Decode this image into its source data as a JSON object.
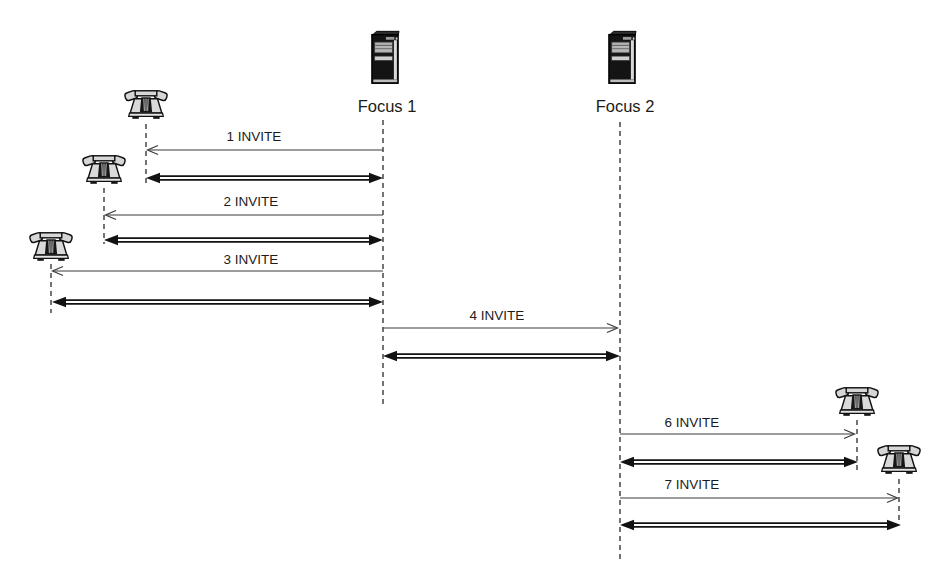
{
  "figure": {
    "type": "sip-conference-sequence-diagram",
    "paper_color": "#ffffff",
    "ink_color": "#1c1c1c",
    "phone_fill": "#d6d6d6",
    "server_fill": "#161616",
    "icons": {
      "phone": "desk-telephone-icon",
      "server": "server-tower-icon"
    },
    "actors": [
      {
        "id": "phone-1",
        "type": "phone",
        "label": ""
      },
      {
        "id": "phone-2",
        "type": "phone",
        "label": ""
      },
      {
        "id": "phone-3",
        "type": "phone",
        "label": ""
      },
      {
        "id": "focus-1",
        "type": "server",
        "label": "Focus 1"
      },
      {
        "id": "focus-2",
        "type": "server",
        "label": "Focus 2"
      },
      {
        "id": "phone-4",
        "type": "phone",
        "label": ""
      },
      {
        "id": "phone-5",
        "type": "phone",
        "label": ""
      }
    ],
    "messages": [
      {
        "label": "1 INVITE",
        "from": "focus-1",
        "to": "phone-1",
        "request_direction": "left",
        "dialog": "bidirectional"
      },
      {
        "label": "2 INVITE",
        "from": "focus-1",
        "to": "phone-2",
        "request_direction": "left",
        "dialog": "bidirectional"
      },
      {
        "label": "3 INVITE",
        "from": "focus-1",
        "to": "phone-3",
        "request_direction": "left",
        "dialog": "bidirectional"
      },
      {
        "label": "4 INVITE",
        "from": "focus-1",
        "to": "focus-2",
        "request_direction": "right",
        "dialog": "bidirectional"
      },
      {
        "label": "6 INVITE",
        "from": "focus-2",
        "to": "phone-4",
        "request_direction": "right",
        "dialog": "bidirectional"
      },
      {
        "label": "7 INVITE",
        "from": "focus-2",
        "to": "phone-5",
        "request_direction": "right",
        "dialog": "bidirectional"
      }
    ]
  }
}
